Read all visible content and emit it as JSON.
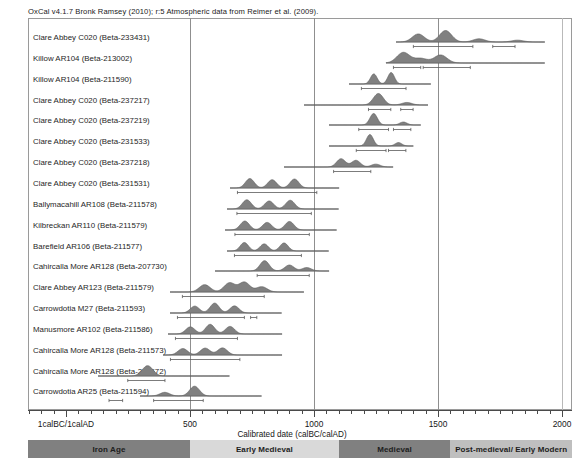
{
  "header": {
    "title": "OxCal v4.1.7 Bronk Ramsey (2010); r:5 Atmospheric data from Reimer et al. (2009)."
  },
  "axis": {
    "caption": "Calibrated date (calBC/calAD)",
    "ticks": [
      {
        "label": "1calBC/1calAD",
        "value": 0
      },
      {
        "label": "500",
        "value": 500
      },
      {
        "label": "1000",
        "value": 1000
      },
      {
        "label": "1500",
        "value": 1500
      },
      {
        "label": "2000",
        "value": 2000
      }
    ],
    "range": [
      -153,
      2048
    ],
    "gridlines": [
      500,
      1000,
      1500,
      2000
    ]
  },
  "periods": [
    {
      "label": "Iron Age",
      "start": -153,
      "end": 500,
      "color": "#808080"
    },
    {
      "label": "Early Medieval",
      "start": 500,
      "end": 1100,
      "color": "#d9d9d9"
    },
    {
      "label": "Medieval",
      "start": 1100,
      "end": 1550,
      "color": "#808080"
    },
    {
      "label": "Post-medieval/ Early Modern",
      "start": 1550,
      "end": 2048,
      "color": "#bfbfbf"
    }
  ],
  "chart_data": {
    "type": "area",
    "title": "OxCal v4.1.7 Bronk Ramsey (2010); r:5 Atmospheric data from Reimer et al. (2009).",
    "xlabel": "Calibrated date (calBC/calAD)",
    "ylabel": "",
    "xlim": [
      -153,
      2048
    ],
    "grid": true,
    "legend": "none",
    "samples": [
      {
        "label": "Clare Abbey C020 (Beta-233431)",
        "span_start": 1330,
        "span_end": 1930,
        "range68_start": 1400,
        "range68_end": 1640,
        "range68b_start": 1720,
        "range68b_end": 1810,
        "peaks": [
          {
            "x": 1420,
            "h": 0.7
          },
          {
            "x": 1530,
            "h": 1.0
          },
          {
            "x": 1665,
            "h": 0.28
          },
          {
            "x": 1820,
            "h": 0.16
          }
        ]
      },
      {
        "label": "Killow AR104 (Beta-213002)",
        "span_start": 1290,
        "span_end": 1930,
        "range68_start": 1320,
        "range68_end": 1430,
        "range68b_start": 1440,
        "range68b_end": 1630,
        "peaks": [
          {
            "x": 1360,
            "h": 0.92
          },
          {
            "x": 1430,
            "h": 0.4
          },
          {
            "x": 1510,
            "h": 0.7
          }
        ]
      },
      {
        "label": "Killow AR104 (Beta-211590)",
        "span_start": 1140,
        "span_end": 1470,
        "range68_start": 1190,
        "range68_end": 1370,
        "peaks": [
          {
            "x": 1240,
            "h": 0.88
          },
          {
            "x": 1310,
            "h": 1.0
          }
        ]
      },
      {
        "label": "Clare Abbey C020 (Beta-237217)",
        "span_start": 960,
        "span_end": 1460,
        "range68_start": 1220,
        "range68_end": 1310,
        "range68b_start": 1350,
        "range68b_end": 1400,
        "peaks": [
          {
            "x": 1260,
            "h": 1.0
          },
          {
            "x": 1375,
            "h": 0.22
          }
        ]
      },
      {
        "label": "Clare Abbey C020 (Beta-237219)",
        "span_start": 1060,
        "span_end": 1430,
        "range68_start": 1180,
        "range68_end": 1300,
        "range68b_start": 1320,
        "range68b_end": 1390,
        "peaks": [
          {
            "x": 1240,
            "h": 1.0
          },
          {
            "x": 1360,
            "h": 0.26
          }
        ]
      },
      {
        "label": "Clare Abbey C020 (Beta-231533)",
        "span_start": 1060,
        "span_end": 1400,
        "range68_start": 1170,
        "range68_end": 1290,
        "range68b_start": 1300,
        "range68b_end": 1370,
        "peaks": [
          {
            "x": 1225,
            "h": 1.0
          },
          {
            "x": 1340,
            "h": 0.3
          }
        ]
      },
      {
        "label": "Clare Abbey C020 (Beta-237218)",
        "span_start": 880,
        "span_end": 1320,
        "range68_start": 1080,
        "range68_end": 1230,
        "peaks": [
          {
            "x": 1110,
            "h": 0.72
          },
          {
            "x": 1170,
            "h": 0.58
          },
          {
            "x": 1250,
            "h": 0.25
          }
        ]
      },
      {
        "label": "Clare Abbey C020 (Beta-231531)",
        "span_start": 660,
        "span_end": 1100,
        "range68_start": 690,
        "range68_end": 1010,
        "peaks": [
          {
            "x": 740,
            "h": 0.82
          },
          {
            "x": 830,
            "h": 0.72
          },
          {
            "x": 920,
            "h": 0.78
          }
        ]
      },
      {
        "label": "Ballymacahill AR108 (Beta-211578)",
        "span_start": 650,
        "span_end": 1100,
        "range68_start": 690,
        "range68_end": 990,
        "peaks": [
          {
            "x": 730,
            "h": 0.8
          },
          {
            "x": 820,
            "h": 0.7
          },
          {
            "x": 905,
            "h": 0.76
          }
        ]
      },
      {
        "label": "Kilbreckan AR110 (Beta-211579)",
        "span_start": 640,
        "span_end": 1090,
        "range68_start": 680,
        "range68_end": 980,
        "peaks": [
          {
            "x": 720,
            "h": 0.78
          },
          {
            "x": 810,
            "h": 0.66
          },
          {
            "x": 900,
            "h": 0.74
          }
        ]
      },
      {
        "label": "Barefield AR106 (Beta-211577)",
        "span_start": 650,
        "span_end": 1060,
        "range68_start": 680,
        "range68_end": 950,
        "peaks": [
          {
            "x": 720,
            "h": 0.74
          },
          {
            "x": 800,
            "h": 0.62
          },
          {
            "x": 880,
            "h": 0.7
          }
        ]
      },
      {
        "label": "Cahircalla More AR128 (Beta-207730)",
        "span_start": 600,
        "span_end": 1060,
        "range68_start": 770,
        "range68_end": 980,
        "peaks": [
          {
            "x": 800,
            "h": 0.9
          },
          {
            "x": 900,
            "h": 0.52
          },
          {
            "x": 970,
            "h": 0.3
          }
        ]
      },
      {
        "label": "Clare Abbey AR123 (Beta-211579)",
        "span_start": 420,
        "span_end": 960,
        "range68_start": 470,
        "range68_end": 800,
        "peaks": [
          {
            "x": 560,
            "h": 0.64
          },
          {
            "x": 660,
            "h": 0.8
          },
          {
            "x": 720,
            "h": 0.86
          },
          {
            "x": 790,
            "h": 0.46
          }
        ]
      },
      {
        "label": "Carrowdotia M27 (Beta-211593)",
        "span_start": 420,
        "span_end": 870,
        "range68_start": 450,
        "range68_end": 720,
        "range68b_start": 745,
        "range68b_end": 770,
        "peaks": [
          {
            "x": 520,
            "h": 0.6
          },
          {
            "x": 600,
            "h": 0.86
          },
          {
            "x": 680,
            "h": 0.62
          }
        ]
      },
      {
        "label": "Manusmore AR102 (Beta-211586)",
        "span_start": 410,
        "span_end": 870,
        "range68_start": 440,
        "range68_end": 690,
        "peaks": [
          {
            "x": 500,
            "h": 0.62
          },
          {
            "x": 580,
            "h": 0.84
          },
          {
            "x": 660,
            "h": 0.66
          }
        ]
      },
      {
        "label": "Cahircalla More AR128 (Beta-211573)",
        "span_start": 390,
        "span_end": 870,
        "range68_start": 420,
        "range68_end": 700,
        "peaks": [
          {
            "x": 470,
            "h": 0.56
          },
          {
            "x": 560,
            "h": 0.6
          },
          {
            "x": 630,
            "h": 0.62
          }
        ]
      },
      {
        "label": "Cahircalla More AR128 (Beta-211572)",
        "span_start": 130,
        "span_end": 660,
        "range68_start": 250,
        "range68_end": 400,
        "peaks": [
          {
            "x": 330,
            "h": 0.9
          }
        ]
      },
      {
        "label": "Carrowdotia AR25 (Beta-211594)",
        "span_start": 300,
        "span_end": 790,
        "range68_start": 355,
        "range68_end": 555,
        "range68b_start": 175,
        "range68b_end": 230,
        "peaks": [
          {
            "x": 400,
            "h": 0.32
          },
          {
            "x": 520,
            "h": 0.85
          }
        ]
      }
    ]
  }
}
